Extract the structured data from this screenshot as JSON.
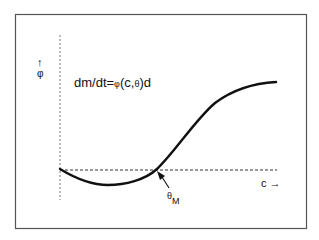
{
  "diagram": {
    "equation": {
      "prefix": "dm/dt=",
      "phi": "φ",
      "args_open": "(c,",
      "theta": "θ",
      "args_close": ")d"
    },
    "y_axis": {
      "arrow": "↑",
      "label": "φ"
    },
    "x_axis": {
      "label": "c →"
    },
    "marker": {
      "symbol": "θ",
      "subscript": "M"
    },
    "colors": {
      "frame": "#555555",
      "curve": "#111111",
      "dashed": "#444444",
      "background": "#ffffff"
    }
  }
}
